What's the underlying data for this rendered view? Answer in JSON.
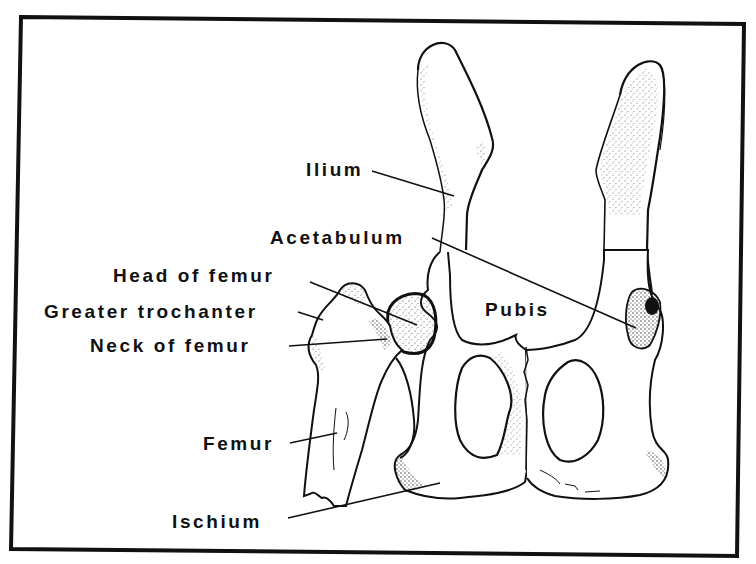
{
  "figure": {
    "colors": {
      "ink": "#111111",
      "background": "#ffffff",
      "stipple": "#333333"
    },
    "labels": [
      {
        "id": "ilium",
        "text": "Ilium"
      },
      {
        "id": "acetabulum",
        "text": "Acetabulum"
      },
      {
        "id": "head-of-femur",
        "text": "Head of femur"
      },
      {
        "id": "greater-trochanter",
        "text": "Greater trochanter"
      },
      {
        "id": "neck-of-femur",
        "text": "Neck of femur"
      },
      {
        "id": "pubis",
        "text": "Pubis"
      },
      {
        "id": "femur",
        "text": "Femur"
      },
      {
        "id": "ischium",
        "text": "Ischium"
      }
    ]
  }
}
